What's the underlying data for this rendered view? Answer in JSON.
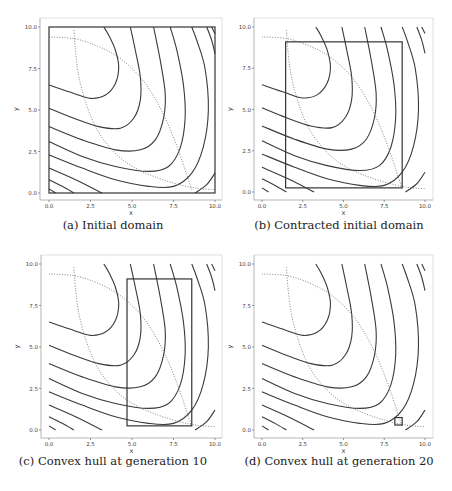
{
  "figure": {
    "panels": [
      {
        "id": "a",
        "caption": "(a) Initial domain",
        "region": {
          "x0": 0,
          "x1": 10,
          "y0": 0,
          "y1": 10
        }
      },
      {
        "id": "b",
        "caption": "(b) Contracted initial domain",
        "region": {
          "x0": 1.45,
          "x1": 8.6,
          "y0": 0.25,
          "y1": 9.1
        }
      },
      {
        "id": "c",
        "caption": "(c) Convex hull at generation 10",
        "region": {
          "x0": 4.7,
          "x1": 8.6,
          "y0": 0.25,
          "y1": 9.1
        }
      },
      {
        "id": "d",
        "caption": "(d) Convex hull at generation 20",
        "region": {
          "x0": 8.15,
          "x1": 8.6,
          "y0": 0.3,
          "y1": 0.75
        }
      }
    ]
  },
  "chart_data": [
    {
      "type": "line",
      "title": "(a) Initial domain",
      "xlabel": "x",
      "ylabel": "y",
      "xlim": [
        0,
        10
      ],
      "ylim": [
        0,
        10
      ],
      "xticks": [
        "0.0",
        "2.5",
        "5.0",
        "7.5",
        "10.0"
      ],
      "yticks": [
        "0.0",
        "2.5",
        "5.0",
        "7.5",
        "10.0"
      ],
      "grid": false,
      "rectangle": {
        "x0": 0,
        "x1": 10,
        "y0": 0,
        "y1": 10
      }
    },
    {
      "type": "line",
      "title": "(b) Contracted initial domain",
      "xlabel": "x",
      "ylabel": "y",
      "xlim": [
        0,
        10
      ],
      "ylim": [
        0,
        10
      ],
      "xticks": [
        "0.0",
        "2.5",
        "5.0",
        "7.5",
        "10.0"
      ],
      "yticks": [
        "0.0",
        "2.5",
        "5.0",
        "7.5",
        "10.0"
      ],
      "grid": false,
      "rectangle": {
        "x0": 1.45,
        "x1": 8.6,
        "y0": 0.25,
        "y1": 9.1
      }
    },
    {
      "type": "line",
      "title": "(c) Convex hull at generation 10",
      "xlabel": "x",
      "ylabel": "y",
      "xlim": [
        0,
        10
      ],
      "ylim": [
        0,
        10
      ],
      "xticks": [
        "0.0",
        "2.5",
        "5.0",
        "7.5",
        "10.0"
      ],
      "yticks": [
        "0.0",
        "2.5",
        "5.0",
        "7.5",
        "10.0"
      ],
      "grid": false,
      "rectangle": {
        "x0": 4.7,
        "x1": 8.6,
        "y0": 0.25,
        "y1": 9.1
      }
    },
    {
      "type": "line",
      "title": "(d) Convex hull at generation 20",
      "xlabel": "x",
      "ylabel": "y",
      "xlim": [
        0,
        10
      ],
      "ylim": [
        0,
        10
      ],
      "xticks": [
        "0.0",
        "2.5",
        "5.0",
        "7.5",
        "10.0"
      ],
      "yticks": [
        "0.0",
        "2.5",
        "5.0",
        "7.5",
        "10.0"
      ],
      "grid": false,
      "rectangle": {
        "x0": 8.15,
        "x1": 8.6,
        "y0": 0.3,
        "y1": 0.75
      }
    }
  ],
  "contours": [
    [
      [
        0,
        6.5
      ],
      [
        1.5,
        6.0
      ],
      [
        2.5,
        5.7
      ],
      [
        3.4,
        5.9
      ],
      [
        4.0,
        6.6
      ],
      [
        4.2,
        7.6
      ],
      [
        4.0,
        8.6
      ],
      [
        3.6,
        9.5
      ],
      [
        3.3,
        10
      ]
    ],
    [
      [
        0,
        5.1
      ],
      [
        1.5,
        4.5
      ],
      [
        3.0,
        4.0
      ],
      [
        4.3,
        3.9
      ],
      [
        5.1,
        4.5
      ],
      [
        5.5,
        5.6
      ],
      [
        5.5,
        7.0
      ],
      [
        5.2,
        8.6
      ],
      [
        4.9,
        10
      ]
    ],
    [
      [
        0,
        4.0
      ],
      [
        2.0,
        3.2
      ],
      [
        4.0,
        2.6
      ],
      [
        5.5,
        2.6
      ],
      [
        6.4,
        3.2
      ],
      [
        6.9,
        4.5
      ],
      [
        7.0,
        6.0
      ],
      [
        6.7,
        8.0
      ],
      [
        6.3,
        10
      ]
    ],
    [
      [
        0,
        3.1
      ],
      [
        2.0,
        2.2
      ],
      [
        4.0,
        1.6
      ],
      [
        6.0,
        1.3
      ],
      [
        7.2,
        1.6
      ],
      [
        7.9,
        2.7
      ],
      [
        8.2,
        4.5
      ],
      [
        8.1,
        6.5
      ],
      [
        7.7,
        8.6
      ],
      [
        7.3,
        10
      ]
    ],
    [
      [
        0,
        2.3
      ],
      [
        2.0,
        1.5
      ],
      [
        4.0,
        0.8
      ],
      [
        6.0,
        0.4
      ],
      [
        7.5,
        0.4
      ],
      [
        8.6,
        1.2
      ],
      [
        9.3,
        2.8
      ],
      [
        9.6,
        5.0
      ],
      [
        9.4,
        7.5
      ],
      [
        8.9,
        9.2
      ],
      [
        8.6,
        10
      ]
    ],
    [
      [
        0,
        1.5
      ],
      [
        1.6,
        0.8
      ],
      [
        3.2,
        0.0
      ]
    ],
    [
      [
        8.8,
        0.0
      ],
      [
        9.5,
        0.5
      ],
      [
        10,
        1.2
      ]
    ],
    [
      [
        9.5,
        10
      ],
      [
        9.8,
        9.2
      ],
      [
        10,
        8.4
      ]
    ],
    [
      [
        0,
        0.8
      ],
      [
        0.8,
        0.4
      ],
      [
        1.5,
        0.0
      ]
    ],
    [
      [
        0,
        0.25
      ],
      [
        0.4,
        0.0
      ]
    ],
    [
      [
        9.8,
        10
      ],
      [
        10,
        9.6
      ]
    ]
  ],
  "dotted_curves": [
    [
      [
        0,
        9.4
      ],
      [
        1.5,
        9.3
      ],
      [
        2.8,
        8.9
      ],
      [
        4.0,
        8.3
      ],
      [
        5.0,
        7.5
      ],
      [
        5.8,
        6.6
      ],
      [
        6.5,
        5.5
      ],
      [
        7.1,
        4.3
      ],
      [
        7.6,
        3.1
      ],
      [
        8.0,
        2.0
      ],
      [
        8.3,
        1.1
      ],
      [
        8.6,
        0.2
      ]
    ],
    [
      [
        1.5,
        9.8
      ],
      [
        1.6,
        8.5
      ],
      [
        1.8,
        7.0
      ],
      [
        2.2,
        5.5
      ],
      [
        2.7,
        4.2
      ],
      [
        3.3,
        3.2
      ],
      [
        4.2,
        2.2
      ],
      [
        5.2,
        1.5
      ],
      [
        6.3,
        1.0
      ],
      [
        7.5,
        0.6
      ],
      [
        8.8,
        0.3
      ],
      [
        10,
        0.2
      ]
    ]
  ]
}
